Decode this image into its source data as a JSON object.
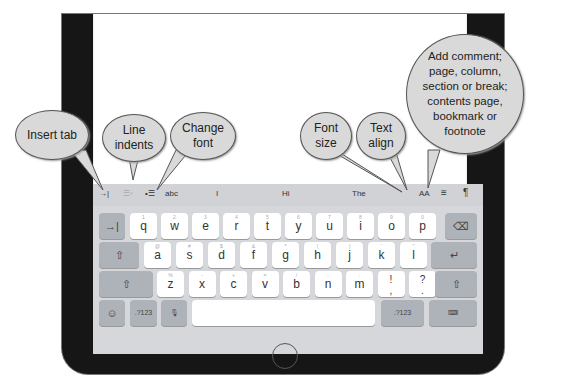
{
  "toolbar": {
    "items": [
      {
        "name": "insert-tab",
        "glyph": "→|"
      },
      {
        "name": "outdent",
        "glyph": "☰‹"
      },
      {
        "name": "indent",
        "glyph": "•☰"
      },
      {
        "name": "change-font",
        "glyph": "abc"
      },
      {
        "name": "suggestion-1",
        "glyph": "I"
      },
      {
        "name": "suggestion-2",
        "glyph": "Hi"
      },
      {
        "name": "suggestion-3",
        "glyph": "The"
      },
      {
        "name": "font-size",
        "glyph": "AA"
      },
      {
        "name": "text-align",
        "glyph": "≡"
      },
      {
        "name": "paragraph",
        "glyph": "¶"
      }
    ]
  },
  "keyboard": {
    "row1": [
      {
        "k": "q",
        "h": "1"
      },
      {
        "k": "w",
        "h": "2"
      },
      {
        "k": "e",
        "h": "3"
      },
      {
        "k": "r",
        "h": "4"
      },
      {
        "k": "t",
        "h": "5"
      },
      {
        "k": "y",
        "h": "6"
      },
      {
        "k": "u",
        "h": "7"
      },
      {
        "k": "i",
        "h": "8"
      },
      {
        "k": "o",
        "h": "9"
      },
      {
        "k": "p",
        "h": "0"
      }
    ],
    "row2": [
      {
        "k": "a",
        "h": "@"
      },
      {
        "k": "s",
        "h": "#"
      },
      {
        "k": "d",
        "h": "$"
      },
      {
        "k": "f",
        "h": "&"
      },
      {
        "k": "g",
        "h": "*"
      },
      {
        "k": "h",
        "h": "("
      },
      {
        "k": "j",
        "h": ")"
      },
      {
        "k": "k",
        "h": "'"
      },
      {
        "k": "l",
        "h": "\""
      }
    ],
    "row3": [
      {
        "k": "z",
        "h": "%"
      },
      {
        "k": "x",
        "h": "-"
      },
      {
        "k": "c",
        "h": "+"
      },
      {
        "k": "v",
        "h": "="
      },
      {
        "k": "b",
        "h": "/"
      },
      {
        "k": "n",
        "h": ";"
      },
      {
        "k": "m",
        "h": ":"
      },
      {
        "k": "!\n,",
        "h": ""
      },
      {
        "k": "?\n.",
        "h": ""
      }
    ],
    "tab_key": "→|",
    "delete_key": "⌫",
    "caps_key": "⇧",
    "return_key": "↵",
    "shift_left": "⇧",
    "shift_right": "⇧",
    "emoji_key": "☺",
    "num_left": ".?123",
    "mic_key": "🎙",
    "space_key": "",
    "num_right": ".?123",
    "hide_key": "⌨"
  },
  "callouts": {
    "insert_tab": "Insert tab",
    "line_indents": "Line indents",
    "change_font": "Change font",
    "font_size": "Font size",
    "text_align": "Text align",
    "paragraph": "Add comment; page, column, section or break; contents page, bookmark or footnote"
  }
}
